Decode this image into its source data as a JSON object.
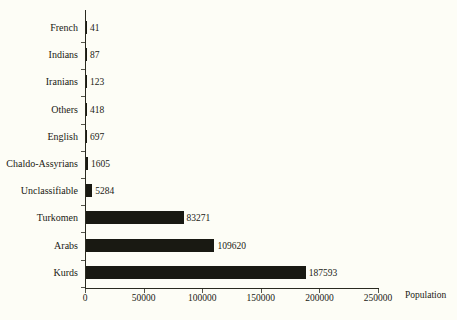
{
  "chart_data": {
    "type": "bar",
    "orientation": "horizontal",
    "title": "",
    "xlabel": "Population",
    "ylabel": "",
    "categories": [
      "French",
      "Indians",
      "Iranians",
      "Others",
      "English",
      "Chaldo-Assyrians",
      "Unclassifiable",
      "Turkomen",
      "Arabs",
      "Kurds"
    ],
    "values": [
      41,
      87,
      123,
      418,
      697,
      1605,
      5284,
      83271,
      109620,
      187593
    ],
    "value_labels": [
      "41",
      "87",
      "123",
      "418",
      "697",
      "1605",
      "5284",
      "83271",
      "109620",
      "187593"
    ],
    "xlim": [
      0,
      250000
    ],
    "xticks": [
      0,
      50000,
      100000,
      150000,
      200000,
      250000
    ],
    "xtick_labels": [
      "0",
      "50000",
      "100000",
      "150000",
      "200000",
      "250000"
    ],
    "grid": false,
    "legend": false,
    "bar_color": "#191912",
    "background_color": "#fdfdf6",
    "axis_color": "#2a2a20"
  }
}
